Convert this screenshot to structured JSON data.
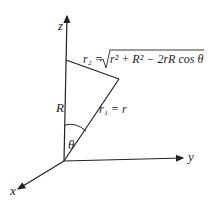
{
  "labels": {
    "z": "z",
    "y": "y",
    "x": "x",
    "R": "R",
    "theta": "θ",
    "r1": "r₁ = r",
    "r2_lhs": "r₂ = ",
    "r2_rhs": "r² + R² − 2rR cos θ"
  }
}
